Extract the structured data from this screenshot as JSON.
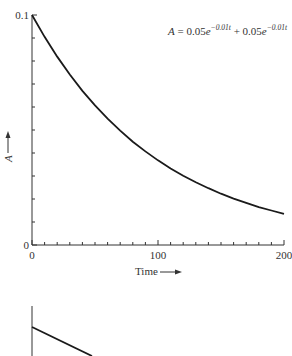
{
  "chart_data": [
    {
      "type": "line",
      "title": "",
      "equation": {
        "lhs": "A",
        "eq": " = 0.05",
        "e1": "e",
        "exp1": "−0.01t",
        "plus": " + 0.05",
        "e2": "e",
        "exp2": "−0.01t"
      },
      "xlabel": "Time",
      "ylabel": "A",
      "xlim": [
        0,
        200
      ],
      "ylim": [
        0,
        0.1
      ],
      "x_ticks": [
        0,
        100,
        200
      ],
      "x_tick_labels": [
        "0",
        "100",
        "200"
      ],
      "x_minor_step": 10,
      "y_ticks": [
        0,
        0.1
      ],
      "y_tick_labels": [
        "0",
        "0.1"
      ],
      "y_minor_step": 0.01,
      "origin_label": "0",
      "series": [
        {
          "name": "A(t)",
          "x": [
            0,
            10,
            20,
            30,
            40,
            50,
            60,
            70,
            80,
            90,
            100,
            110,
            120,
            130,
            140,
            150,
            160,
            170,
            180,
            190,
            200
          ],
          "values": [
            0.1,
            0.0905,
            0.0819,
            0.0741,
            0.067,
            0.0607,
            0.0549,
            0.0497,
            0.0449,
            0.0407,
            0.0368,
            0.0333,
            0.0301,
            0.0273,
            0.0247,
            0.0223,
            0.0202,
            0.0183,
            0.0165,
            0.015,
            0.0135
          ]
        }
      ],
      "grid": false
    },
    {
      "type": "line",
      "title": "",
      "note": "partially visible second chart (cropped at bottom)",
      "series": [
        {
          "name": "partial line",
          "x": [
            0,
            1
          ],
          "values": [
            1,
            0
          ]
        }
      ]
    }
  ]
}
